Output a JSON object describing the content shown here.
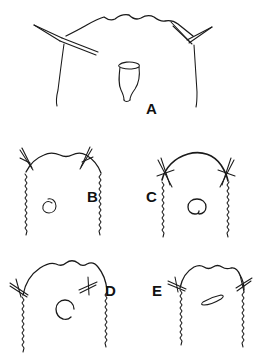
{
  "figure": {
    "kind": "line-drawing-plate",
    "background_color": "#ffffff",
    "ink_color": "#1a1a1a",
    "panel_count": 5,
    "caption_text": "",
    "title_text": ""
  },
  "panels": [
    {
      "id": "A",
      "label": "A",
      "label_x": 146,
      "label_y": 101,
      "description": "wide rounded outline with two long lateral spines and a central vase-shaped structure",
      "central_structure": "vase-shape",
      "lateral_spines": 2,
      "margin": "smooth"
    },
    {
      "id": "B",
      "label": "B",
      "label_x": 87,
      "label_y": 189,
      "description": "rounded outline with serrate lateral margins, two short apical spines and a small spiral structure",
      "central_structure": "spiral",
      "lateral_spines": 2,
      "margin": "serrate"
    },
    {
      "id": "C",
      "label": "C",
      "label_x": 146,
      "label_y": 189,
      "description": "smooth domed outline with crossed lateral spines and an open ring structure",
      "central_structure": "open-ring",
      "lateral_spines": 2,
      "margin": "serrate"
    },
    {
      "id": "D",
      "label": "D",
      "label_x": 105,
      "label_y": 283,
      "description": "scalloped dome outline with crossed lateral spines and an open horseshoe ring structure",
      "central_structure": "horseshoe-ring",
      "lateral_spines": 2,
      "margin": "serrate"
    },
    {
      "id": "E",
      "label": "E",
      "label_x": 152,
      "label_y": 283,
      "description": "narrow scalloped outline with crossed lateral spines and a small elongate slit structure",
      "central_structure": "elongate-slit",
      "lateral_spines": 2,
      "margin": "serrate"
    }
  ],
  "labels": {
    "a": "A",
    "b": "B",
    "c": "C",
    "d": "D",
    "e": "E"
  }
}
